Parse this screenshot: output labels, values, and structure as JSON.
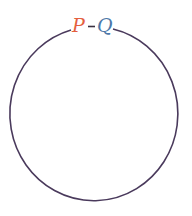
{
  "diagram": {
    "type": "cycle",
    "nodes": [
      {
        "id": "P",
        "label": "P",
        "color": "#e4603f"
      },
      {
        "id": "Q",
        "label": "Q",
        "color": "#4d78a8"
      }
    ],
    "edges": [
      {
        "from": "P",
        "to": "Q",
        "label": "-",
        "style": "short-dash"
      },
      {
        "from": "Q",
        "to": "P",
        "style": "large-circular-arc"
      }
    ],
    "connector_label": "–",
    "line_color": "#4a3a5c"
  }
}
